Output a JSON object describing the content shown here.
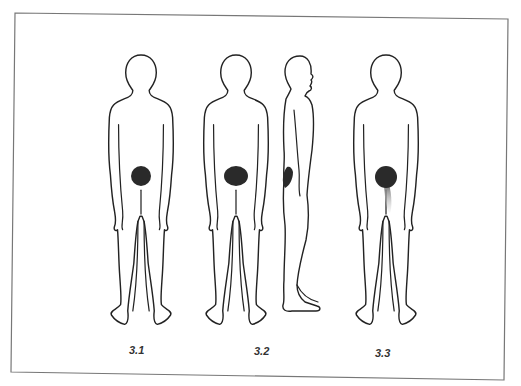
{
  "figure": {
    "panels": [
      {
        "id": "3.1",
        "label": "3.1",
        "view": "back",
        "pain_area": "central buttock",
        "pain_color": "#2a2a2a",
        "referral": "none"
      },
      {
        "id": "3.2",
        "label": "3.2",
        "view": "back and side",
        "pain_area": "sacral/buttock, wider",
        "pain_color": "#2a2a2a",
        "referral": "none"
      },
      {
        "id": "3.3",
        "label": "3.3",
        "view": "back",
        "pain_area": "buttock",
        "pain_color": "#2a2a2a",
        "referral": "fading down posterior thigh",
        "referral_color": "#9a9a9a"
      }
    ],
    "frame_color": "#777777",
    "line_color": "#222222"
  }
}
